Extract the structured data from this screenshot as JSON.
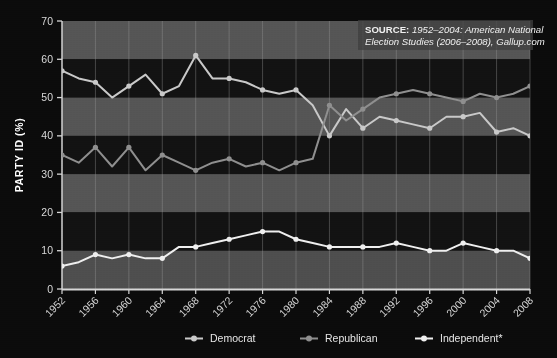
{
  "chart_data": {
    "type": "line",
    "title": "",
    "xlabel": "",
    "ylabel": "PARTY ID (%)",
    "ylim": [
      0,
      70
    ],
    "yticks": [
      0,
      10,
      20,
      30,
      40,
      50,
      60,
      70
    ],
    "grid": true,
    "legend_position": "bottom",
    "categories": [
      "1952",
      "1954",
      "1956",
      "1958",
      "1960",
      "1962",
      "1964",
      "1966",
      "1968",
      "1970",
      "1972",
      "1974",
      "1976",
      "1978",
      "1980",
      "1982",
      "1984",
      "1986",
      "1988",
      "1990",
      "1992",
      "1994",
      "1996",
      "1998",
      "2000",
      "2002",
      "2004",
      "2006",
      "2008"
    ],
    "xtick_labels": [
      "1952",
      "1956",
      "1960",
      "1964",
      "1968",
      "1972",
      "1976",
      "1980",
      "1984",
      "1988",
      "1992",
      "1996",
      "2000",
      "2004",
      "2008"
    ],
    "series": [
      {
        "name": "Democrat",
        "color": "#c9c9c9",
        "values": [
          57,
          55,
          54,
          50,
          53,
          56,
          51,
          53,
          61,
          55,
          55,
          54,
          52,
          51,
          52,
          48,
          40,
          47,
          42,
          45,
          44,
          43,
          42,
          45,
          45,
          46,
          41,
          42,
          40
        ]
      },
      {
        "name": "Republican",
        "color": "#8f8f8f",
        "values": [
          35,
          33,
          37,
          32,
          37,
          31,
          35,
          33,
          31,
          33,
          34,
          32,
          33,
          31,
          33,
          34,
          48,
          44,
          47,
          50,
          51,
          52,
          51,
          50,
          49,
          51,
          50,
          51,
          53
        ]
      },
      {
        "name": "Independent*",
        "color": "#efefef",
        "values": [
          6,
          7,
          9,
          8,
          9,
          8,
          8,
          11,
          11,
          12,
          13,
          14,
          15,
          15,
          13,
          12,
          11,
          11,
          11,
          11,
          12,
          11,
          10,
          10,
          12,
          11,
          10,
          10,
          8
        ]
      }
    ],
    "annotations": [
      {
        "name": "source-note",
        "line1_bold": "SOURCE:",
        "line1_rest": " 1952–2004: American National",
        "line2": "Election Studies (2006–2008), Gallup.com"
      }
    ]
  },
  "legend": {
    "items": [
      {
        "label": "Democrat",
        "color": "#c9c9c9"
      },
      {
        "label": "Republican",
        "color": "#8f8f8f"
      },
      {
        "label": "Independent*",
        "color": "#efefef"
      }
    ]
  },
  "axes": {
    "y_title": "PARTY ID (%)",
    "y_ticks": [
      "0",
      "10",
      "20",
      "30",
      "40",
      "50",
      "60",
      "70"
    ],
    "x_ticks": [
      "1952",
      "1956",
      "1960",
      "1964",
      "1968",
      "1972",
      "1976",
      "1980",
      "1984",
      "1988",
      "1992",
      "1996",
      "2000",
      "2004",
      "2008"
    ]
  },
  "source": {
    "bold": "SOURCE:",
    "rest": " 1952–2004: American National",
    "line2": "Election Studies (2006–2008), Gallup.com"
  }
}
